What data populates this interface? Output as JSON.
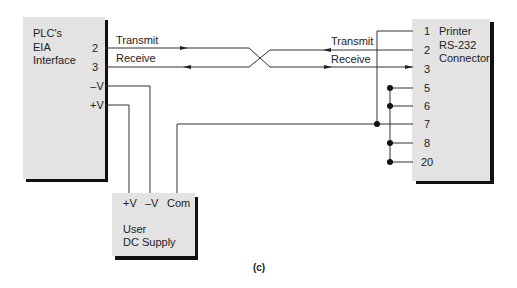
{
  "plc_box": {
    "title_lines": [
      "PLC's",
      "EIA",
      "Interface"
    ],
    "pins": [
      "2",
      "3",
      "–V",
      "+V"
    ]
  },
  "printer_box": {
    "title_lines": [
      "Printer",
      "RS-232",
      "Connector"
    ],
    "pins": [
      "1",
      "2",
      "3",
      "5",
      "6",
      "7",
      "8",
      "20"
    ]
  },
  "supply_box": {
    "terminals": [
      "+V",
      "–V",
      "Com"
    ],
    "title_lines": [
      "User",
      "DC Supply"
    ]
  },
  "signals": {
    "plc_transmit": "Transmit",
    "plc_receive": "Receive",
    "printer_transmit": "Transmit",
    "printer_receive": "Receive"
  },
  "caption": "(c)",
  "colors": {
    "box_fill": "#e3e3e3",
    "shadow": "#111111",
    "wire": "#333333"
  }
}
